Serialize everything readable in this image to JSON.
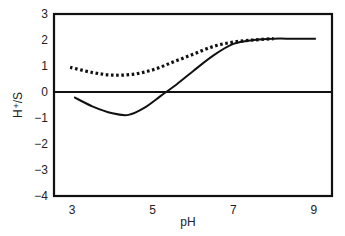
{
  "chart_data": {
    "type": "line",
    "title": "",
    "xlabel": "pH",
    "ylabel": "H⁺/S",
    "xlim": [
      2.55,
      9.45
    ],
    "ylim": [
      -4,
      3
    ],
    "xticks": [
      3,
      5,
      7,
      9
    ],
    "yticks": [
      3,
      2,
      1,
      0,
      -1,
      -2,
      -3,
      -4
    ],
    "xtick_labels": [
      "3",
      "5",
      "7",
      "9"
    ],
    "ytick_labels": [
      "3",
      "2",
      "1",
      "0",
      "−1",
      "−2",
      "−3",
      "−4"
    ],
    "grid": false,
    "legend": null,
    "zero_line": true,
    "series": [
      {
        "name": "solid",
        "style": "solid",
        "color": "#111111",
        "x": [
          3.05,
          3.5,
          4.0,
          4.4,
          4.8,
          5.2,
          5.6,
          6.0,
          6.5,
          7.0,
          7.5,
          8.0,
          8.5,
          9.05
        ],
        "y": [
          -0.2,
          -0.55,
          -0.82,
          -0.88,
          -0.6,
          -0.15,
          0.3,
          0.8,
          1.4,
          1.85,
          2.0,
          2.05,
          2.05,
          2.05
        ]
      },
      {
        "name": "dotted",
        "style": "dotted",
        "color": "#111111",
        "x": [
          2.95,
          3.5,
          4.0,
          4.5,
          5.0,
          5.5,
          6.0,
          6.5,
          7.0,
          7.5,
          8.0
        ],
        "y": [
          0.95,
          0.75,
          0.65,
          0.68,
          0.85,
          1.15,
          1.45,
          1.75,
          1.92,
          2.0,
          2.05
        ]
      }
    ]
  }
}
